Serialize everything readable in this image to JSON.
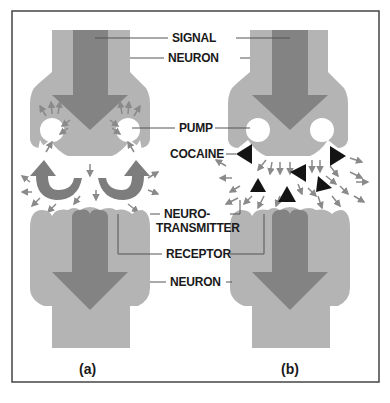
{
  "figure": {
    "frame_color": "#444444",
    "colors": {
      "neuron_fill": "#b4b4b4",
      "neuron_shadow": "#d8d8d8",
      "signal_arrow": "#838383",
      "recycle_arrow": "#7d7d7d",
      "small_arrow": "#8a8a8a",
      "cocaine": "#141414",
      "label_line": "#555555"
    },
    "labels": {
      "signal": "SIGNAL",
      "neuron_top": "NEURON",
      "pump": "PUMP",
      "cocaine": "COCAINE",
      "neurotransmitter_line1": "NEURO-",
      "neurotransmitter_line2": "TRANSMITTER",
      "receptor": "RECEPTOR",
      "neuron_bottom": "NEURON"
    },
    "panels": [
      {
        "id": "a",
        "caption": "(a)",
        "description": "Normal reuptake: pumps recycle neurotransmitter"
      },
      {
        "id": "b",
        "caption": "(b)",
        "description": "Cocaine blocks pumps; neurotransmitter accumulates"
      }
    ]
  }
}
